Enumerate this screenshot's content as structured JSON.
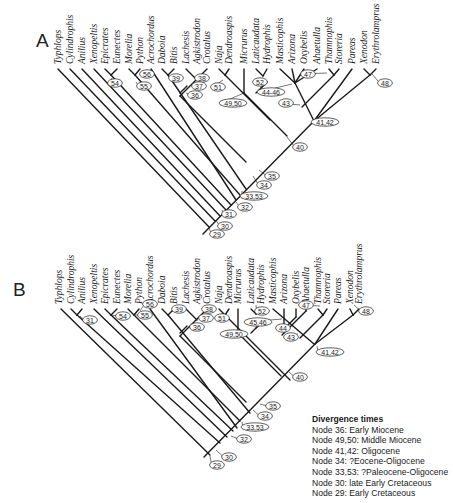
{
  "figure": {
    "panels": [
      {
        "id": "A",
        "label": "A",
        "label_pos": [
          36,
          43
        ],
        "tip_y": 69,
        "taxa": [
          {
            "name": "Typhlops",
            "x": 58
          },
          {
            "name": "Cylindrophis",
            "x": 70
          },
          {
            "name": "Anilius",
            "x": 82
          },
          {
            "name": "Xenopeltis",
            "x": 94
          },
          {
            "name": "Epicrates",
            "x": 105
          },
          {
            "name": "Eunectes",
            "x": 117
          },
          {
            "name": "Morelia",
            "x": 129
          },
          {
            "name": "Python",
            "x": 140
          },
          {
            "name": "Acrochordus",
            "x": 151
          },
          {
            "name": "Daboia",
            "x": 162
          },
          {
            "name": "Bitis",
            "x": 174
          },
          {
            "name": "Lachesis",
            "x": 186
          },
          {
            "name": "Agkistrodon",
            "x": 197
          },
          {
            "name": "Crotalus",
            "x": 207
          },
          {
            "name": "Naja",
            "x": 219
          },
          {
            "name": "Dendroaspis",
            "x": 229
          },
          {
            "name": "Micrurus",
            "x": 244
          },
          {
            "name": "Laticaudata",
            "x": 256
          },
          {
            "name": "Hydrophis",
            "x": 267
          },
          {
            "name": "Masticophis",
            "x": 280
          },
          {
            "name": "Arizona",
            "x": 292
          },
          {
            "name": "Oxybelis",
            "x": 304
          },
          {
            "name": "Ahaetulla",
            "x": 317
          },
          {
            "name": "Thamnophis",
            "x": 329
          },
          {
            "name": "Storeria",
            "x": 339
          },
          {
            "name": "Pareas",
            "x": 352
          },
          {
            "name": "Xenodon",
            "x": 364
          },
          {
            "name": "Erythrolamprus",
            "x": 376
          }
        ],
        "lines": [
          [
            203,
            234,
            314,
            121
          ],
          [
            58,
            69,
            209,
            227
          ],
          [
            70,
            69,
            215,
            221
          ],
          [
            82,
            69,
            220,
            216
          ],
          [
            94,
            69,
            226,
            210
          ],
          [
            111,
            75,
            231,
            205
          ],
          [
            105,
            69,
            111,
            75
          ],
          [
            117,
            69,
            111,
            75
          ],
          [
            135,
            75,
            240,
            195
          ],
          [
            129,
            69,
            135,
            75
          ],
          [
            140,
            69,
            135,
            75
          ],
          [
            151,
            69,
            236,
            200
          ],
          [
            168,
            75,
            246,
            189
          ],
          [
            162,
            69,
            168,
            75
          ],
          [
            174,
            69,
            168,
            75
          ],
          [
            180,
            93,
            187,
            86
          ],
          [
            186,
            69,
            197,
            80
          ],
          [
            207,
            69,
            180,
            96
          ],
          [
            225,
            75,
            270,
            120
          ],
          [
            219,
            69,
            225,
            75
          ],
          [
            229,
            69,
            225,
            75
          ],
          [
            244,
            69,
            244,
            93
          ],
          [
            256,
            93,
            267,
            82
          ],
          [
            261,
            88,
            267,
            82
          ],
          [
            256,
            69,
            263,
            76
          ],
          [
            267,
            69,
            263,
            76
          ],
          [
            280,
            69,
            295,
            83
          ],
          [
            292,
            69,
            295,
            83
          ],
          [
            304,
            69,
            295,
            83
          ],
          [
            317,
            69,
            295,
            83
          ],
          [
            295,
            83,
            314,
            121
          ],
          [
            334,
            75,
            302,
            107
          ],
          [
            329,
            69,
            334,
            75
          ],
          [
            339,
            69,
            334,
            75
          ],
          [
            352,
            69,
            314,
            121
          ],
          [
            370,
            75,
            314,
            121
          ],
          [
            364,
            69,
            370,
            75
          ],
          [
            376,
            69,
            370,
            75
          ],
          [
            180,
            96,
            246,
            162
          ],
          [
            244,
            93,
            287,
            136
          ]
        ],
        "nodes": [
          {
            "label": "54",
            "x": 115,
            "y": 83,
            "lx": 112,
            "ly": 78
          },
          {
            "label": "56",
            "x": 147,
            "y": 74,
            "lx": 140,
            "ly": 73
          },
          {
            "label": "55",
            "x": 144,
            "y": 86,
            "lx": 136,
            "ly": 82
          },
          {
            "label": "39",
            "x": 176,
            "y": 78,
            "lx": 170,
            "ly": 77
          },
          {
            "label": "38",
            "x": 202,
            "y": 78,
            "lx": 197,
            "ly": 78
          },
          {
            "label": "37",
            "x": 199,
            "y": 86,
            "lx": 194,
            "ly": 85
          },
          {
            "label": "36",
            "x": 195,
            "y": 95,
            "lx": 186,
            "ly": 93
          },
          {
            "label": "51",
            "x": 218,
            "y": 87,
            "lx": 223,
            "ly": 80
          },
          {
            "label": "52",
            "x": 260,
            "y": 82,
            "lx": 263,
            "ly": 78
          },
          {
            "label": "49,50",
            "x": 233,
            "y": 103,
            "lx": 244,
            "ly": 93
          },
          {
            "label": "44-46",
            "x": 271,
            "y": 92,
            "lx": 292,
            "ly": 84
          },
          {
            "label": "47",
            "x": 308,
            "y": 74,
            "lx": 327,
            "ly": 73
          },
          {
            "label": "43",
            "x": 286,
            "y": 103,
            "lx": 300,
            "ly": 105
          },
          {
            "label": "41,42",
            "x": 325,
            "y": 122,
            "lx": 316,
            "ly": 120
          },
          {
            "label": "48",
            "x": 385,
            "y": 83,
            "lx": 372,
            "ly": 74
          },
          {
            "label": "40",
            "x": 300,
            "y": 147,
            "lx": 287,
            "ly": 137
          },
          {
            "label": "35",
            "x": 272,
            "y": 176,
            "lx": 259,
            "ly": 170
          },
          {
            "label": "34",
            "x": 264,
            "y": 185,
            "lx": 253,
            "ly": 176
          },
          {
            "label": "33,53",
            "x": 254,
            "y": 196,
            "lx": 242,
            "ly": 191
          },
          {
            "label": "32",
            "x": 245,
            "y": 207,
            "lx": 236,
            "ly": 202
          },
          {
            "label": "31",
            "x": 229,
            "y": 214,
            "lx": 222,
            "ly": 210
          },
          {
            "label": "30",
            "x": 225,
            "y": 226,
            "lx": 216,
            "ly": 220
          },
          {
            "label": "29",
            "x": 217,
            "y": 234,
            "lx": 209,
            "ly": 228
          }
        ]
      },
      {
        "id": "B",
        "label": "B",
        "label_pos": [
          13,
          292
        ],
        "tip_y": 309,
        "taxa": [
          {
            "name": "Typhlops",
            "x": 59
          },
          {
            "name": "Cylindrophis",
            "x": 71
          },
          {
            "name": "Anilius",
            "x": 82
          },
          {
            "name": "Xenopeltis",
            "x": 94
          },
          {
            "name": "Epicrates",
            "x": 105
          },
          {
            "name": "Eunectes",
            "x": 117
          },
          {
            "name": "Morelia",
            "x": 128
          },
          {
            "name": "Python",
            "x": 139
          },
          {
            "name": "Acrochordus",
            "x": 150
          },
          {
            "name": "Daboia",
            "x": 162
          },
          {
            "name": "Bitis",
            "x": 174
          },
          {
            "name": "Lachesis",
            "x": 186
          },
          {
            "name": "Agkistrodon",
            "x": 197
          },
          {
            "name": "Crotalus",
            "x": 207
          },
          {
            "name": "Naja",
            "x": 219
          },
          {
            "name": "Dendroaspis",
            "x": 229
          },
          {
            "name": "Micrurus",
            "x": 238
          },
          {
            "name": "Laticaudata",
            "x": 251
          },
          {
            "name": "Hydrophis",
            "x": 261
          },
          {
            "name": "Masticophis",
            "x": 273
          },
          {
            "name": "Arizona",
            "x": 284
          },
          {
            "name": "Oxybelis",
            "x": 296
          },
          {
            "name": "Ahaetulla",
            "x": 306
          },
          {
            "name": "Thamnophis",
            "x": 318
          },
          {
            "name": "Storeria",
            "x": 327
          },
          {
            "name": "Pareas",
            "x": 338
          },
          {
            "name": "Xenodon",
            "x": 350
          },
          {
            "name": "Erythrolamprus",
            "x": 359
          }
        ],
        "lines": [
          [
            204,
            457,
            315,
            344
          ],
          [
            61,
            309,
            210,
            455
          ],
          [
            77,
            315,
            220,
            443
          ],
          [
            71,
            309,
            77,
            315
          ],
          [
            82,
            309,
            77,
            315
          ],
          [
            94,
            309,
            227,
            437
          ],
          [
            111,
            315,
            233,
            431
          ],
          [
            105,
            309,
            111,
            315
          ],
          [
            117,
            309,
            111,
            315
          ],
          [
            134,
            315,
            240,
            421
          ],
          [
            128,
            309,
            134,
            315
          ],
          [
            139,
            309,
            134,
            315
          ],
          [
            150,
            309,
            237,
            428
          ],
          [
            168,
            315,
            250,
            413
          ],
          [
            162,
            309,
            168,
            315
          ],
          [
            174,
            309,
            168,
            315
          ],
          [
            180,
            333,
            187,
            326
          ],
          [
            186,
            309,
            197,
            320
          ],
          [
            207,
            309,
            180,
            336
          ],
          [
            225,
            315,
            290,
            380
          ],
          [
            219,
            309,
            225,
            315
          ],
          [
            229,
            309,
            225,
            315
          ],
          [
            238,
            309,
            238,
            333
          ],
          [
            251,
            333,
            261,
            323
          ],
          [
            256,
            328,
            261,
            323
          ],
          [
            251,
            309,
            256,
            314
          ],
          [
            261,
            309,
            256,
            314
          ],
          [
            273,
            309,
            314,
            344
          ],
          [
            284,
            309,
            284,
            326
          ],
          [
            286,
            327,
            296,
            317
          ],
          [
            296,
            309,
            296,
            317
          ],
          [
            282,
            335,
            306,
            311
          ],
          [
            306,
            309,
            306,
            311
          ],
          [
            323,
            315,
            300,
            338
          ],
          [
            318,
            309,
            323,
            315
          ],
          [
            327,
            309,
            323,
            315
          ],
          [
            338,
            309,
            315,
            344
          ],
          [
            353,
            315,
            315,
            344
          ],
          [
            350,
            309,
            353,
            315
          ],
          [
            359,
            309,
            353,
            315
          ],
          [
            180,
            336,
            246,
            402
          ],
          [
            238,
            333,
            281,
            376
          ]
        ],
        "nodes": [
          {
            "label": "31",
            "x": 90,
            "y": 320,
            "lx": 80,
            "ly": 316
          },
          {
            "label": "54",
            "x": 123,
            "y": 316,
            "lx": 111,
            "ly": 315
          },
          {
            "label": "56",
            "x": 150,
            "y": 304,
            "lx": 140,
            "ly": 311
          },
          {
            "label": "55",
            "x": 145,
            "y": 315,
            "lx": 135,
            "ly": 315
          },
          {
            "label": "39",
            "x": 179,
            "y": 309,
            "lx": 172,
            "ly": 312
          },
          {
            "label": "38",
            "x": 209,
            "y": 309,
            "lx": 204,
            "ly": 311
          },
          {
            "label": "37",
            "x": 206,
            "y": 318,
            "lx": 199,
            "ly": 318
          },
          {
            "label": "36",
            "x": 197,
            "y": 327,
            "lx": 190,
            "ly": 327
          },
          {
            "label": "51",
            "x": 222,
            "y": 318,
            "lx": 223,
            "ly": 313
          },
          {
            "label": "52",
            "x": 262,
            "y": 311,
            "lx": 256,
            "ly": 305
          },
          {
            "label": "45,46",
            "x": 258,
            "y": 322,
            "lx": 282,
            "ly": 319
          },
          {
            "label": "49,50",
            "x": 234,
            "y": 334,
            "lx": 238,
            "ly": 333
          },
          {
            "label": "44",
            "x": 283,
            "y": 328,
            "lx": 286,
            "ly": 325
          },
          {
            "label": "47",
            "x": 306,
            "y": 305,
            "lx": 320,
            "ly": 306
          },
          {
            "label": "43",
            "x": 291,
            "y": 337,
            "lx": 298,
            "ly": 334
          },
          {
            "label": "41,42",
            "x": 330,
            "y": 352,
            "lx": 317,
            "ly": 346
          },
          {
            "label": "48",
            "x": 366,
            "y": 311,
            "lx": 354,
            "ly": 305
          },
          {
            "label": "40",
            "x": 300,
            "y": 377,
            "lx": 289,
            "ly": 372
          },
          {
            "label": "35",
            "x": 273,
            "y": 406,
            "lx": 260,
            "ly": 404
          },
          {
            "label": "34",
            "x": 265,
            "y": 416,
            "lx": 253,
            "ly": 410
          },
          {
            "label": "33,53",
            "x": 255,
            "y": 427,
            "lx": 242,
            "ly": 422
          },
          {
            "label": "32",
            "x": 244,
            "y": 439,
            "lx": 231,
            "ly": 436
          },
          {
            "label": "30",
            "x": 229,
            "y": 457,
            "lx": 216,
            "ly": 450
          },
          {
            "label": "29",
            "x": 217,
            "y": 465,
            "lx": 210,
            "ly": 456
          }
        ]
      }
    ],
    "legend": {
      "title": "Divergence times",
      "items": [
        "Node 36: Early Miocene",
        "Node 49,50: Middle Miocene",
        "Node 41,42: Oligocene",
        "Node 34: ?Eocene-Oligocene",
        "Node 33,53: ?Paleocene-Oligocene",
        "Node 30: late Early Cretaceous",
        "Node 29: Early Cretaceous"
      ]
    },
    "colors": {
      "line": "#1a1a1a",
      "background": "#ffffff"
    }
  }
}
